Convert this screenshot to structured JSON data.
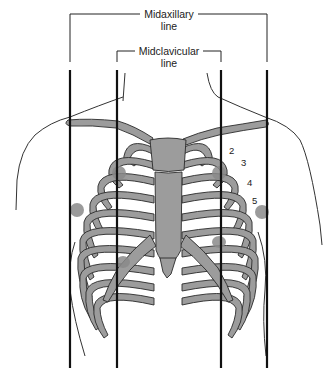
{
  "labels": {
    "midaxillary_line": [
      "Midaxillary",
      "line"
    ],
    "midclavicular_line": [
      "Midclavicular",
      "line"
    ]
  },
  "rib_numbers": [
    "2",
    "3",
    "4",
    "5"
  ],
  "colors": {
    "bone": "#9c9c9c",
    "outline": "#2a2a2a",
    "electrode": "#8a8a8a",
    "guide_line": "#111111"
  }
}
